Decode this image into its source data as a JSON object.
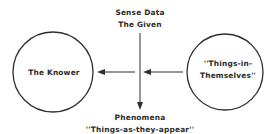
{
  "diagram": {
    "type": "epistemology-diagram",
    "nodes": {
      "knower": {
        "label": "The Knower"
      },
      "things_in_themselves": {
        "lines": [
          "''Things-in-",
          "Themselves''"
        ]
      }
    },
    "top_label": {
      "lines": [
        "Sense Data",
        "The Given"
      ]
    },
    "bottom_label": {
      "lines": [
        "Phenomena",
        "''Things-as-they-appear''"
      ]
    },
    "edges": [
      {
        "from": "things_in_themselves",
        "to": "center",
        "direction": "left"
      },
      {
        "from": "center",
        "to": "knower",
        "direction": "left"
      },
      {
        "from": "top_label",
        "to": "bottom_label",
        "direction": "down"
      }
    ],
    "colors": {
      "ink": "#2e2e2e",
      "background": "#ffffff"
    }
  }
}
